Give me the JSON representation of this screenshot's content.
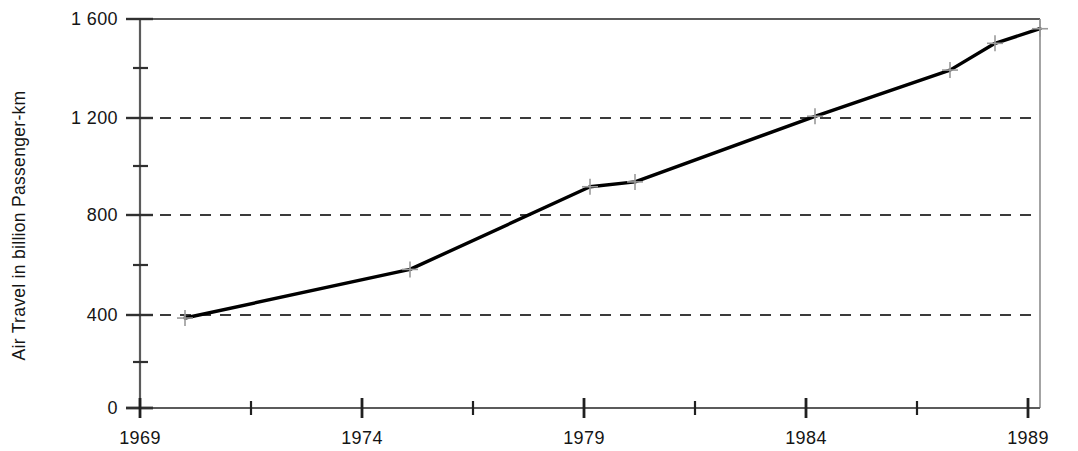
{
  "chart_data": {
    "type": "line",
    "title": "",
    "subtitle": "",
    "xlabel": "",
    "ylabel": "Air Travel in billion Passenger-km",
    "x": [
      1970,
      1975,
      1979,
      1980,
      1984,
      1987,
      1988,
      1989
    ],
    "values": [
      370,
      570,
      910,
      930,
      1200,
      1390,
      1500,
      1560
    ],
    "series": [
      {
        "name": "Air Travel",
        "x": [
          1970,
          1975,
          1979,
          1980,
          1984,
          1987,
          1988,
          1989
        ],
        "values": [
          370,
          570,
          910,
          930,
          1200,
          1390,
          1500,
          1560
        ],
        "color": "#000000",
        "marker": "plus"
      }
    ],
    "xlim": [
      1969,
      1989
    ],
    "ylim": [
      0,
      1600
    ],
    "x_major_ticks": [
      1969,
      1974,
      1979,
      1984,
      1989
    ],
    "x_major_tick_labels": [
      "1969",
      "1974",
      "1979",
      "1984",
      "1989"
    ],
    "x_minor_ticks": [
      1971.5,
      1976.5,
      1981.5,
      1986.5
    ],
    "y_major_ticks": [
      0,
      400,
      800,
      1200,
      1600
    ],
    "y_major_tick_labels": [
      "0",
      "400",
      "800",
      "1 200",
      "1 600"
    ],
    "y_minor_ticks": [
      200,
      600,
      1000,
      1400
    ],
    "grid": {
      "horizontal": true,
      "vertical": false,
      "style": "dashed",
      "values": [
        400,
        800,
        1200
      ],
      "color": "#3a3a3a"
    },
    "legend": null,
    "annotations": [],
    "frame": {
      "top": true,
      "right": true,
      "bottom": true,
      "left": true,
      "color": "#555555"
    },
    "line_color": "#000000",
    "line_width": 3.2
  },
  "axes": {
    "y_label": "Air Travel in billion Passenger-km",
    "y_tick_labels": [
      "1 600",
      "1 200",
      "800",
      "400",
      "0"
    ],
    "x_tick_labels": [
      "1969",
      "1974",
      "1979",
      "1984",
      "1989"
    ]
  }
}
